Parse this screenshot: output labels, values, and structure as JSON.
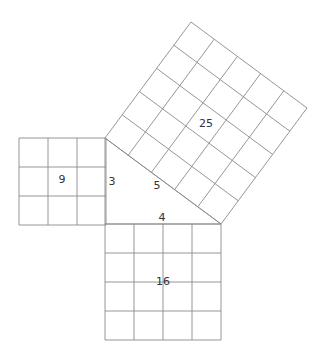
{
  "diagram": {
    "title": "",
    "unit_cell_px": 29,
    "line_color": "#8a8a8a",
    "text_color": "#333333",
    "triangle": {
      "vertices": [
        [
          105,
          138
        ],
        [
          105,
          224
        ],
        [
          221,
          224
        ]
      ],
      "sides": {
        "a": "3",
        "b": "4",
        "c": "5"
      }
    },
    "squares": [
      {
        "id": "square-a",
        "side": 3,
        "area_label": "9",
        "origin": [
          19,
          138
        ],
        "u": [
          29,
          0
        ],
        "v": [
          0,
          29
        ]
      },
      {
        "id": "square-b",
        "side": 4,
        "area_label": "16",
        "origin": [
          105,
          224
        ],
        "u": [
          29,
          0
        ],
        "v": [
          0,
          29
        ]
      },
      {
        "id": "square-c",
        "side": 5,
        "area_label": "25",
        "origin": [
          105,
          138
        ],
        "u": [
          23.2,
          17.2
        ],
        "v": [
          17.2,
          -23.2
        ]
      }
    ],
    "labels": {
      "area_a": {
        "text": "9",
        "x": 62,
        "y": 180
      },
      "area_b": {
        "text": "16",
        "x": 163,
        "y": 282
      },
      "area_c": {
        "text": "25",
        "x": 206,
        "y": 124
      },
      "side_a": {
        "text": "3",
        "x": 112,
        "y": 182
      },
      "side_b": {
        "text": "4",
        "x": 162,
        "y": 218
      },
      "side_c": {
        "text": "5",
        "x": 157,
        "y": 186
      }
    }
  }
}
